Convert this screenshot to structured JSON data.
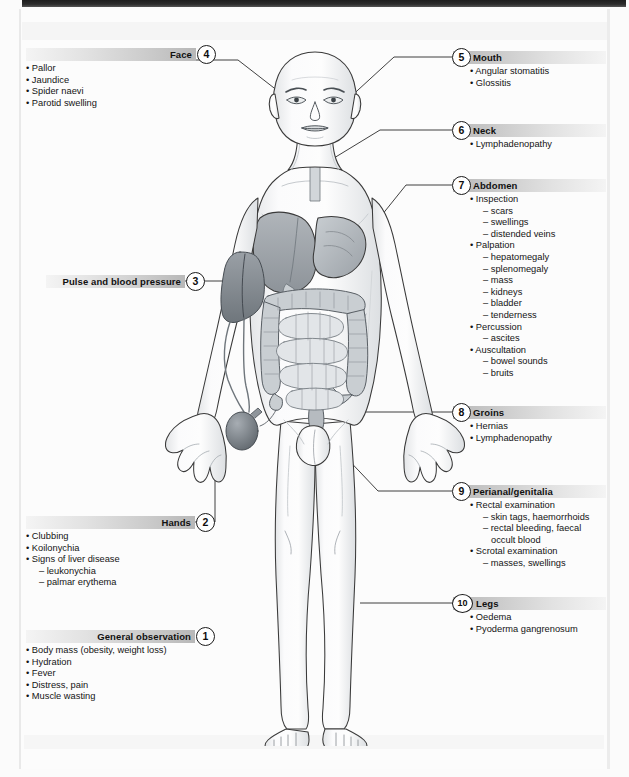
{
  "document": {
    "kind": "medical-examination-diagram",
    "subject": "Abdominal examination — systematic physical examination checklist"
  },
  "sections": [
    {
      "id": 1,
      "number": "1",
      "title": "General observation",
      "side": "left",
      "indent": "flush",
      "items": [
        {
          "level": 1,
          "text": "• Body mass (obesity, weight loss)"
        },
        {
          "level": 1,
          "text": "• Hydration"
        },
        {
          "level": 1,
          "text": "• Fever"
        },
        {
          "level": 1,
          "text": "• Distress, pain"
        },
        {
          "level": 1,
          "text": "• Muscle wasting"
        }
      ]
    },
    {
      "id": 2,
      "number": "2",
      "title": "Hands",
      "side": "left",
      "indent": "flush",
      "items": [
        {
          "level": 1,
          "text": "• Clubbing"
        },
        {
          "level": 1,
          "text": "• Koilonychia"
        },
        {
          "level": 1,
          "text": "• Signs of liver disease"
        },
        {
          "level": 2,
          "text": "– leukonychia"
        },
        {
          "level": 2,
          "text": "– palmar erythema"
        }
      ]
    },
    {
      "id": 3,
      "number": "3",
      "title": "Pulse and blood pressure",
      "side": "left",
      "indent": "flush",
      "items": []
    },
    {
      "id": 4,
      "number": "4",
      "title": "Face",
      "side": "left",
      "indent": "flush",
      "items": [
        {
          "level": 1,
          "text": "• Pallor"
        },
        {
          "level": 1,
          "text": "• Jaundice"
        },
        {
          "level": 1,
          "text": "• Spider naevi"
        },
        {
          "level": 1,
          "text": "• Parotid swelling"
        }
      ]
    },
    {
      "id": 5,
      "number": "5",
      "title": "Mouth",
      "side": "right",
      "indent": "indent",
      "items": [
        {
          "level": 1,
          "text": "• Angular stomatitis"
        },
        {
          "level": 1,
          "text": "• Glossitis"
        }
      ]
    },
    {
      "id": 6,
      "number": "6",
      "title": "Neck",
      "side": "right",
      "indent": "indent",
      "items": [
        {
          "level": 1,
          "text": "• Lymphadenopathy"
        }
      ]
    },
    {
      "id": 7,
      "number": "7",
      "title": "Abdomen",
      "side": "right",
      "indent": "indent",
      "items": [
        {
          "level": 1,
          "text": "• Inspection"
        },
        {
          "level": 2,
          "text": "– scars"
        },
        {
          "level": 2,
          "text": "– swellings"
        },
        {
          "level": 2,
          "text": "– distended veins"
        },
        {
          "level": 1,
          "text": "• Palpation"
        },
        {
          "level": 2,
          "text": "– hepatomegaly"
        },
        {
          "level": 2,
          "text": "– splenomegaly"
        },
        {
          "level": 2,
          "text": "– mass"
        },
        {
          "level": 2,
          "text": "– kidneys"
        },
        {
          "level": 2,
          "text": "– bladder"
        },
        {
          "level": 2,
          "text": "– tenderness"
        },
        {
          "level": 1,
          "text": "• Percussion"
        },
        {
          "level": 2,
          "text": "– ascites"
        },
        {
          "level": 1,
          "text": "• Auscultation"
        },
        {
          "level": 2,
          "text": "– bowel sounds"
        },
        {
          "level": 2,
          "text": "– bruits"
        }
      ]
    },
    {
      "id": 8,
      "number": "8",
      "title": "Groins",
      "side": "right",
      "indent": "indent",
      "items": [
        {
          "level": 1,
          "text": "• Hernias"
        },
        {
          "level": 1,
          "text": "• Lymphadenopathy"
        }
      ]
    },
    {
      "id": 9,
      "number": "9",
      "title": "Perianal/genitalia",
      "side": "right",
      "indent": "indent",
      "items": [
        {
          "level": 1,
          "text": "• Rectal examination"
        },
        {
          "level": 2,
          "text": "– skin tags, haemorrhoids"
        },
        {
          "level": 2,
          "text": "– rectal bleeding, faecal"
        },
        {
          "level": 3,
          "text": "occult blood"
        },
        {
          "level": 1,
          "text": "• Scrotal examination"
        },
        {
          "level": 2,
          "text": "– masses, swellings"
        }
      ]
    },
    {
      "id": 10,
      "number": "10",
      "title": "Legs",
      "side": "right",
      "indent": "indent",
      "items": [
        {
          "level": 1,
          "text": "• Oedema"
        },
        {
          "level": 1,
          "text": "• Pyoderma gangrenosum"
        }
      ]
    }
  ],
  "figure": {
    "name": "anterior-male-body-with-abdominal-organs",
    "parts": [
      "head",
      "face",
      "neck",
      "torso",
      "arms",
      "hands",
      "legs",
      "feet",
      "liver",
      "stomach",
      "large-intestine",
      "small-intestine",
      "blood-pressure-cuff",
      "sphygmomanometer-bulb",
      "scrotum"
    ]
  },
  "colors": {
    "page": "#fcfcfc",
    "bar_dark": "#b8b8b8",
    "bar_light": "#f4f4f4",
    "text": "#141414",
    "outline": "#3a3a3a",
    "organ_fill": "#b9bdc2"
  }
}
